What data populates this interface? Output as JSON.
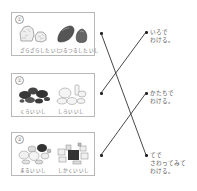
{
  "groups": [
    {
      "number": "①",
      "left_label": "ざらざらした いし",
      "right_label": "つるつるした いし"
    },
    {
      "number": "②",
      "left_label": "くろい いし",
      "right_label": "しろい いし"
    },
    {
      "number": "③",
      "left_label": "まるい いし",
      "right_label": "しかくい いし"
    }
  ],
  "methods": [
    {
      "line1": "いろで",
      "line2": "わける。",
      "line3": ""
    },
    {
      "line1": "かたちで",
      "line2": "わける。",
      "line3": ""
    },
    {
      "line1": "てで",
      "line2": "さわってみて",
      "line3": "わける。"
    }
  ],
  "connections": [
    {
      "from_group": 1,
      "to_method": 3
    },
    {
      "from_group": 2,
      "to_method": 1
    },
    {
      "from_group": 3,
      "to_method": 2
    }
  ],
  "colors": {
    "line": "#333333",
    "box_border": "#b8b8b8",
    "dark_rock": "#3a3a3a",
    "light_rock": "#e8e8e8"
  }
}
